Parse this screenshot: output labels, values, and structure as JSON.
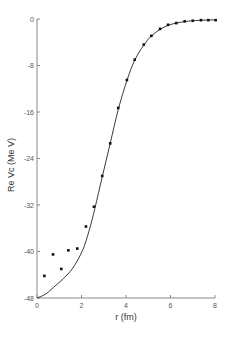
{
  "chart_data": {
    "type": "scatter",
    "title": "",
    "xlabel": "r (fm)",
    "ylabel": "Re Vc (Me V)",
    "xlim": [
      0,
      8
    ],
    "ylim": [
      -48,
      0
    ],
    "xticks": [
      0,
      2,
      4,
      6,
      8
    ],
    "xtick_labels": [
      "0",
      "2",
      "4",
      "6",
      "8"
    ],
    "yticks": [
      0,
      -8,
      -16,
      -24,
      -32,
      -40,
      -48
    ],
    "ytick_labels": [
      "0",
      "-8",
      "-16",
      "-24",
      "-32",
      "-40",
      "-48"
    ],
    "grid": false,
    "legend": null,
    "series": [
      {
        "name": "data points",
        "kind": "scatter",
        "x": [
          0.33,
          0.72,
          1.09,
          1.41,
          1.81,
          2.2,
          2.56,
          2.93,
          3.29,
          3.65,
          4.04,
          4.39,
          4.8,
          5.14,
          5.53,
          5.89,
          6.26,
          6.64,
          7.0,
          7.37,
          7.7,
          8.03
        ],
        "y": [
          -44.2,
          -40.5,
          -43.0,
          -39.8,
          -39.5,
          -35.7,
          -32.3,
          -27.0,
          -21.4,
          -15.3,
          -10.5,
          -7.0,
          -4.4,
          -2.9,
          -1.7,
          -1.0,
          -0.7,
          -0.4,
          -0.3,
          -0.2,
          -0.2,
          -0.2
        ]
      },
      {
        "name": "fit curve",
        "kind": "line",
        "x": [
          0,
          0.4,
          0.85,
          1.2,
          1.6,
          2.05,
          2.35,
          2.6,
          2.93,
          3.29,
          3.65,
          4.04,
          4.39,
          4.8,
          5.14,
          5.53,
          5.89,
          6.26,
          6.64,
          7.0,
          7.5,
          8.0
        ],
        "y": [
          -48,
          -47.3,
          -45.8,
          -44.6,
          -42.9,
          -39.8,
          -36.3,
          -32.6,
          -27.2,
          -21.4,
          -15.6,
          -10.6,
          -7.1,
          -4.5,
          -2.9,
          -1.8,
          -1.1,
          -0.7,
          -0.45,
          -0.3,
          -0.2,
          -0.15
        ]
      }
    ]
  },
  "plot_area": {
    "x0_px": 37,
    "x1_px": 215,
    "y0_px": 19,
    "y1_px": 298
  }
}
